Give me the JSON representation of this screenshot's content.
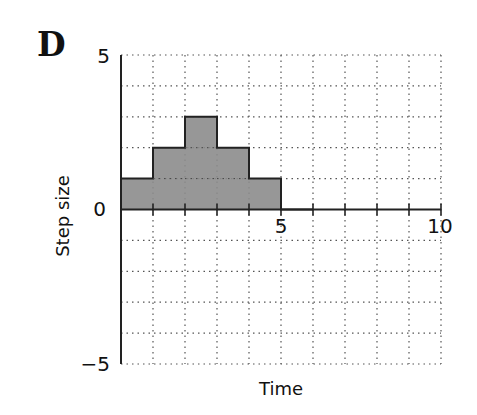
{
  "panel_label": "D",
  "chart_data": {
    "type": "bar",
    "style": "step-histogram",
    "title": "",
    "xlabel": "Time",
    "ylabel": "Step size",
    "xlim": [
      0,
      10
    ],
    "ylim": [
      -5,
      5
    ],
    "x_ticks_labeled": [
      5,
      10
    ],
    "y_ticks_labeled": [
      -5,
      0,
      5
    ],
    "grid": true,
    "grid_style": "dotted",
    "grid_step": 1,
    "categories": [
      "0-1",
      "1-2",
      "2-3",
      "3-4",
      "4-5",
      "5-6",
      "6-7",
      "7-8",
      "8-9",
      "9-10"
    ],
    "bins": [
      [
        0,
        1
      ],
      [
        1,
        2
      ],
      [
        2,
        3
      ],
      [
        3,
        4
      ],
      [
        4,
        5
      ],
      [
        5,
        6
      ],
      [
        6,
        7
      ],
      [
        7,
        8
      ],
      [
        8,
        9
      ],
      [
        9,
        10
      ]
    ],
    "values": [
      1,
      2,
      3,
      2,
      1,
      0,
      0,
      0,
      0,
      0
    ],
    "fill_color": "#8c8c8c",
    "edge_color": "#222222",
    "legend": null
  },
  "axis": {
    "y_top_label": "5",
    "y_zero_label": "0",
    "y_bottom_label": "−5",
    "x_mid_label": "5",
    "x_end_label": "10",
    "xlabel": "Time",
    "ylabel": "Step size"
  }
}
